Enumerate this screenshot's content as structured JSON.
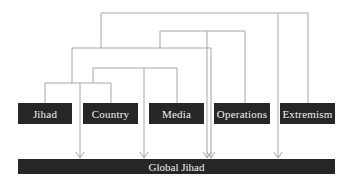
{
  "diagram": {
    "type": "hierarchical-connector-diagram",
    "colors": {
      "box_fill": "#262626",
      "box_text": "#f2f2f2",
      "connector": "#a6a6a6",
      "background": "#ffffff"
    },
    "nodes": [
      {
        "id": "jihad",
        "label": "Jihad"
      },
      {
        "id": "country",
        "label": "Country"
      },
      {
        "id": "media",
        "label": "Media"
      },
      {
        "id": "operations",
        "label": "Operations"
      },
      {
        "id": "extremism",
        "label": "Extremism"
      }
    ],
    "target": {
      "id": "global-jihad",
      "label": "Global Jihad"
    },
    "connections": [
      {
        "from": [
          "jihad",
          "country"
        ],
        "to": "global-jihad"
      },
      {
        "from": [
          "jihad+country",
          "media"
        ],
        "to": "global-jihad"
      },
      {
        "from": [
          "jihad+country+media",
          "operations-group"
        ],
        "to": "global-jihad"
      },
      {
        "from": [
          "operations-group",
          "operations"
        ],
        "to": "global-jihad"
      },
      {
        "from": [
          "all-left",
          "extremism"
        ],
        "to": "global-jihad"
      }
    ]
  }
}
